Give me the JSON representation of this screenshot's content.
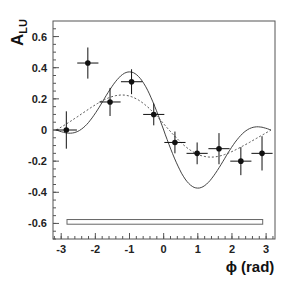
{
  "chart_data": {
    "type": "scatter",
    "title": "",
    "xlabel": "ϕ (rad)",
    "ylabel": "A",
    "ylabel_subscript": "LU",
    "xlim": [
      -3.24,
      3.26
    ],
    "ylim": [
      -0.7,
      0.7
    ],
    "x_ticks": [
      -3,
      -2,
      -1,
      0,
      1,
      2,
      3
    ],
    "x_tick_labels": [
      "-3",
      "-2",
      "-1",
      "0",
      "1",
      "2",
      "3"
    ],
    "y_ticks": [
      -0.6,
      -0.4,
      -0.2,
      0,
      0.2,
      0.4,
      0.6
    ],
    "y_tick_labels": [
      "-0.6",
      "-0.4",
      "-0.2",
      "0",
      "0.2",
      "0.4",
      "0.6"
    ],
    "x_minor_step": 0.2,
    "y_minor_step": 0.05,
    "grid": false,
    "legend": null,
    "series": [
      {
        "name": "data",
        "style": "points-with-errorbars",
        "x": [
          -2.85,
          -2.22,
          -1.57,
          -0.94,
          -0.29,
          0.33,
          0.98,
          1.62,
          2.26,
          2.88
        ],
        "y": [
          0.0,
          0.43,
          0.18,
          0.31,
          0.1,
          -0.08,
          -0.15,
          -0.12,
          -0.2,
          -0.15
        ],
        "yerr": [
          0.12,
          0.1,
          0.09,
          0.08,
          0.07,
          0.07,
          0.07,
          0.1,
          0.09,
          0.11
        ],
        "xerr": [
          0.31,
          0.31,
          0.31,
          0.31,
          0.31,
          0.31,
          0.31,
          0.31,
          0.31,
          0.31
        ]
      },
      {
        "name": "solid-curve",
        "style": "solid",
        "model": "-a*sin(phi) - b*sin(2phi) + c*(1+cos(phi))",
        "a": 0.26,
        "b": 0.17,
        "c": 0.0,
        "x_range": [
          -3.1416,
          3.1416
        ]
      },
      {
        "name": "dotted-curve",
        "style": "dotted",
        "model": "-a*sin(phi) - b*sin(2phi) + c*(1+cos(phi))",
        "a": 0.19,
        "b": 0.03,
        "c": 0.02,
        "x_range": [
          -3.1416,
          3.1416
        ]
      }
    ],
    "systematic_band": {
      "x_start": -2.83,
      "x_end": 2.9,
      "y_center": -0.59,
      "height": 0.03
    }
  },
  "colors": {
    "frame": "#555555",
    "points": "#111111",
    "curves": "#444444",
    "band": "#666666"
  }
}
